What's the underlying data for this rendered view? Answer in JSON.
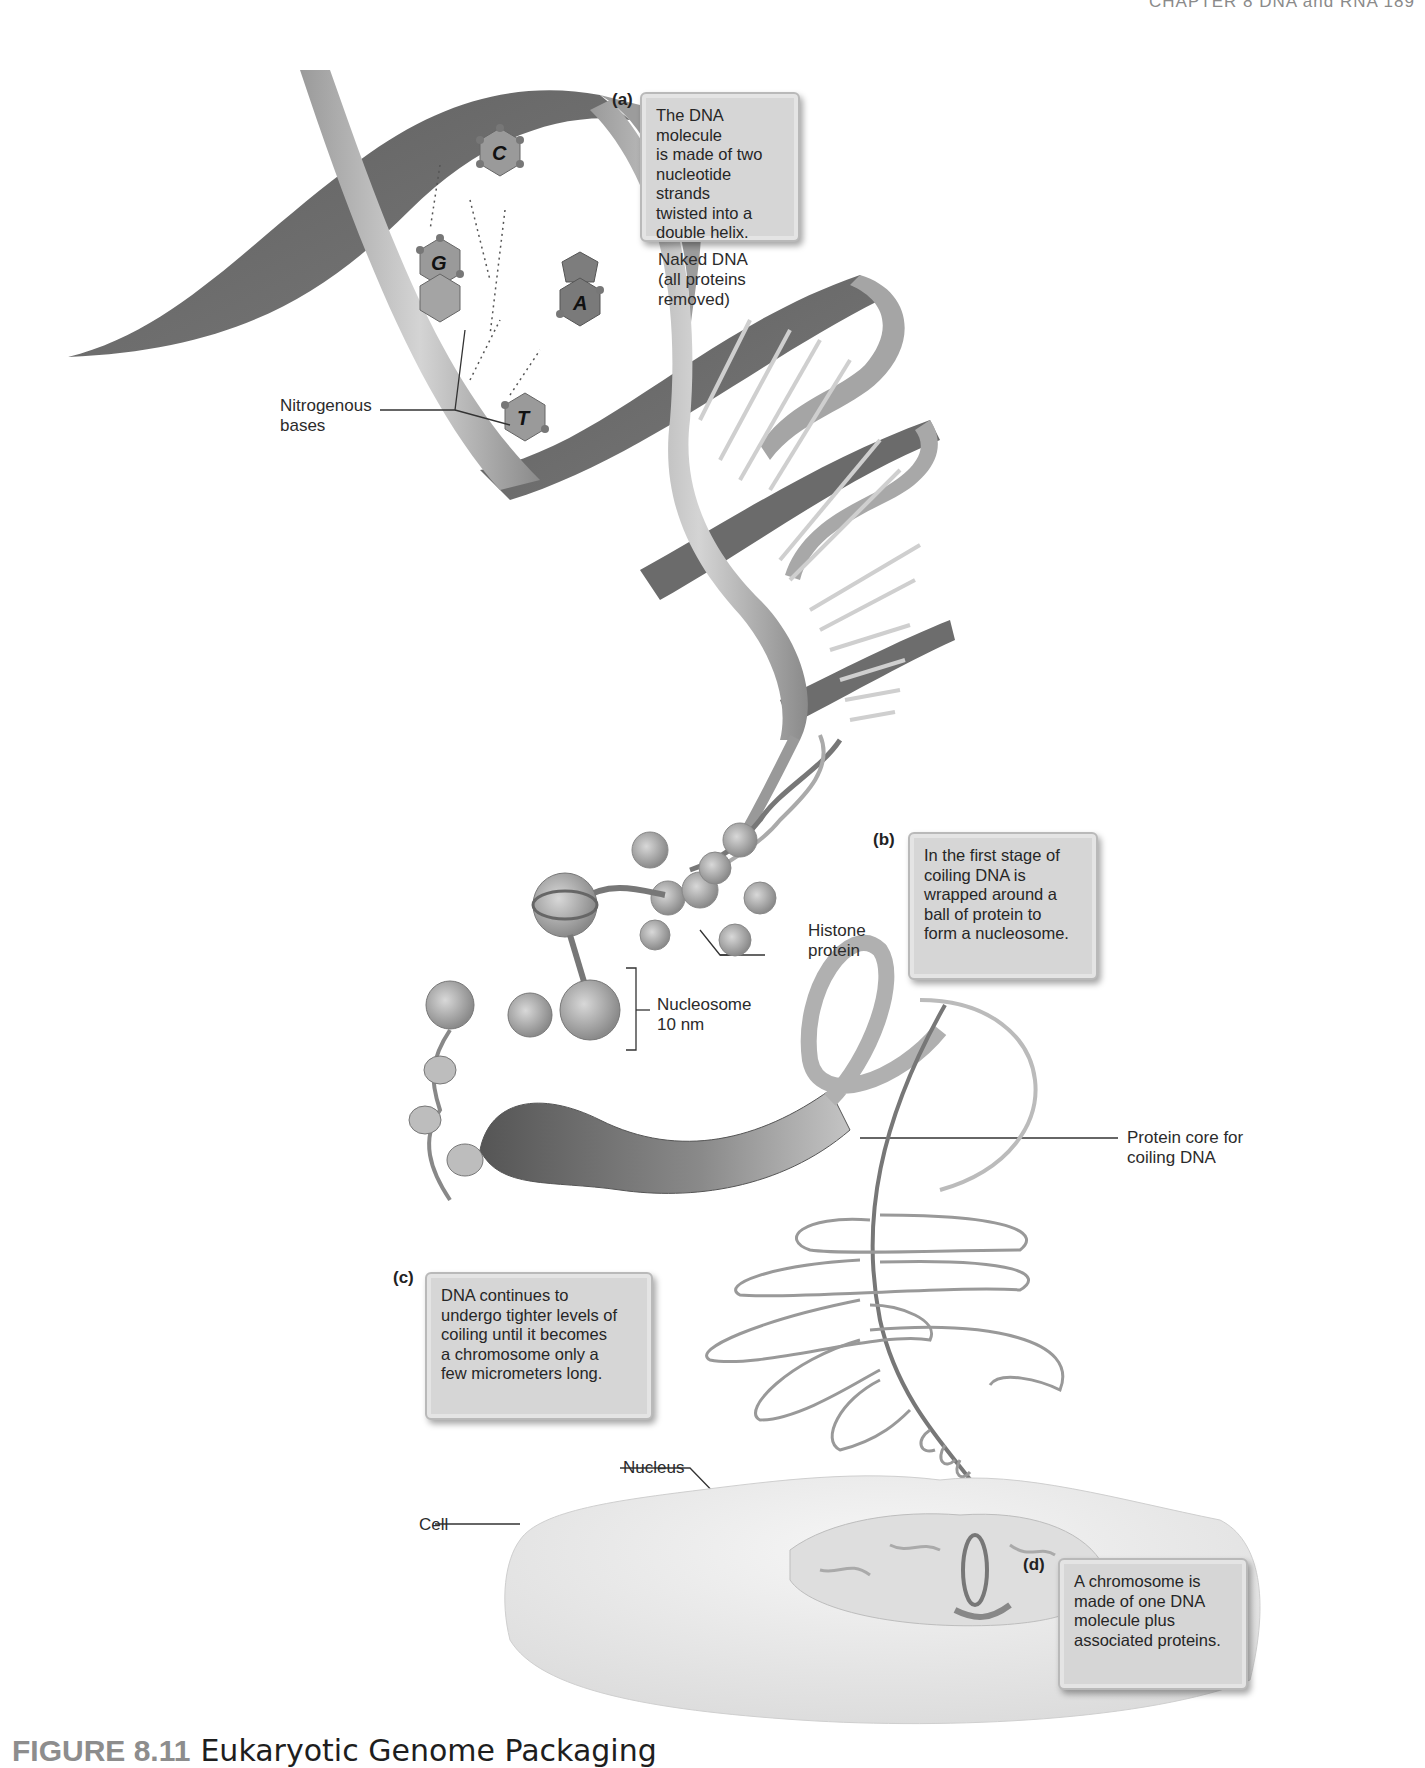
{
  "running_head": "CHAPTER 8   DNA and RNA   189",
  "panels": {
    "a": {
      "letter": "(a)",
      "callout": "The DNA molecule\nis made of two\nnucleotide strands\ntwisted into a\ndouble helix."
    },
    "b": {
      "letter": "(b)",
      "callout": "In the first stage of\ncoiling DNA is\nwrapped around a\nball of protein to\nform a nucleosome."
    },
    "c": {
      "letter": "(c)",
      "callout": "DNA continues to\nundergo tighter levels of\ncoiling until it becomes\na chromosome only a\nfew micrometers long."
    },
    "d": {
      "letter": "(d)",
      "callout": "A chromosome is\nmade of one DNA\nmolecule plus\nassociated proteins."
    }
  },
  "labels": {
    "naked_dna": "Naked DNA\n(all proteins\nremoved)",
    "nitrogenous_bases": "Nitrogenous\nbases",
    "histone_protein": "Histone\nprotein",
    "nucleosome": "Nucleosome\n10 nm",
    "protein_core": "Protein core for\ncoiling DNA",
    "nucleus": "Nucleus",
    "cell": "Cell"
  },
  "bases": [
    "C",
    "G",
    "A",
    "T"
  ],
  "caption": {
    "figure_number": "FIGURE 8.11",
    "title": "Eukaryotic Genome Packaging"
  },
  "colors": {
    "ribbon_dark": "#6e6e6e",
    "ribbon_light": "#b8b8b8",
    "callout_fill": "#d6d6d6",
    "base_fill": "#8f8f8f",
    "cell_fill": "#ececec"
  }
}
